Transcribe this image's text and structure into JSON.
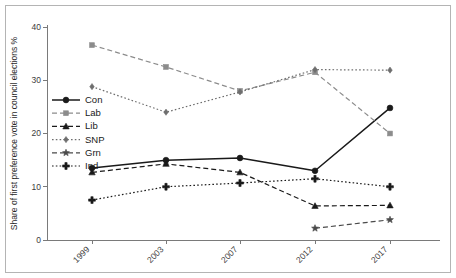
{
  "chart_data": {
    "type": "line",
    "title": "",
    "xlabel": "",
    "ylabel": "Share of first preference vote in council elections %",
    "categories": [
      "1999",
      "2003",
      "2007",
      "2012",
      "2017"
    ],
    "ylim": [
      0,
      40
    ],
    "yticks": [
      0,
      10,
      20,
      30,
      40
    ],
    "ytick_labels": [
      "0",
      "10",
      "20",
      "30",
      "40"
    ],
    "grid": false,
    "legend_position": "left-middle",
    "series": [
      {
        "name": "Con",
        "marker": "circle",
        "linestyle": "solid",
        "color": "#1a1a1a",
        "values": [
          13.5,
          15.0,
          15.4,
          13.0,
          24.8
        ]
      },
      {
        "name": "Lab",
        "marker": "square",
        "linestyle": "dashed",
        "color": "#8c8c8c",
        "values": [
          36.6,
          32.5,
          28.0,
          31.5,
          20.0
        ]
      },
      {
        "name": "Lib",
        "marker": "triangle",
        "linestyle": "dashed",
        "color": "#1a1a1a",
        "values": [
          12.7,
          14.3,
          12.7,
          6.4,
          6.5
        ]
      },
      {
        "name": "SNP",
        "marker": "diamond",
        "linestyle": "dotted",
        "color": "#6e6e6e",
        "values": [
          28.8,
          24.0,
          27.8,
          32.0,
          31.9
        ]
      },
      {
        "name": "Grn",
        "marker": "star",
        "linestyle": "dashed",
        "color": "#4a4a4a",
        "values": [
          null,
          null,
          null,
          2.2,
          3.8
        ]
      },
      {
        "name": "Ind",
        "marker": "plus",
        "linestyle": "dotted",
        "color": "#1a1a1a",
        "values": [
          7.5,
          10.0,
          10.7,
          11.5,
          10.0
        ]
      }
    ]
  },
  "legend": {
    "items": [
      {
        "label": "Con"
      },
      {
        "label": "Lab"
      },
      {
        "label": "Lib"
      },
      {
        "label": "SNP"
      },
      {
        "label": "Grn"
      },
      {
        "label": "Ind"
      }
    ]
  },
  "colors": {
    "axis": "#7a7a7a",
    "frame_border": "#b4b4b4",
    "background": "#ffffff",
    "text": "#2a2a2a"
  }
}
